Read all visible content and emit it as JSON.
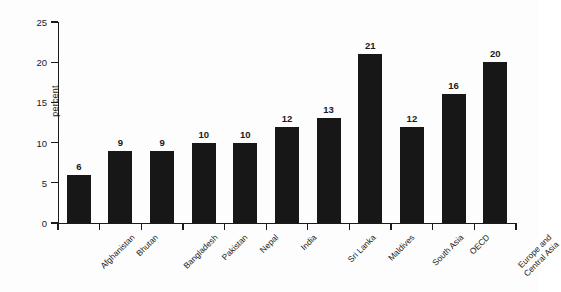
{
  "chart_data": {
    "type": "bar",
    "title": "",
    "subtitle": "",
    "xlabel": "",
    "ylabel": "percent",
    "ylim": [
      0,
      25
    ],
    "yticks": [
      0,
      5,
      10,
      15,
      20,
      25
    ],
    "ytick_labels": [
      "0",
      "5",
      "10",
      "15",
      "20",
      "25"
    ],
    "grid": false,
    "legend": null,
    "categories": [
      "Afghanistan",
      "Bhutan",
      "Bangladesh",
      "Pakistan",
      "Nepal",
      "India",
      "Sri Lanka",
      "Maldives",
      "South Asia",
      "OECD",
      "Europe and Central Asia"
    ],
    "category_lines": [
      [
        "Afghanistan"
      ],
      [
        "Bhutan"
      ],
      [
        "Bangladesh"
      ],
      [
        "Pakistan"
      ],
      [
        "Nepal"
      ],
      [
        "India"
      ],
      [
        "Sri Lanka"
      ],
      [
        "Maldives"
      ],
      [
        "South Asia"
      ],
      [
        "OECD"
      ],
      [
        "Europe and",
        "Central Asia"
      ]
    ],
    "values": [
      6,
      9,
      9,
      10,
      10,
      12,
      13,
      21,
      12,
      16,
      20
    ],
    "value_labels": [
      "6",
      "9",
      "9",
      "10",
      "10",
      "12",
      "13",
      "21",
      "12",
      "16",
      "20"
    ],
    "bar_color": "#171717",
    "axis_color": "#1a1a1a",
    "background_color": "#fdfdfd"
  }
}
